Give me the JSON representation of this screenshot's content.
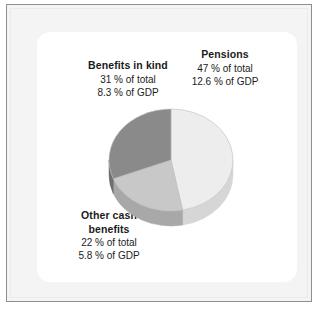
{
  "figure": {
    "background_color": "#f4f4f4",
    "card_color": "#ffffff",
    "frame_color": "#8e8e90"
  },
  "chart_data": {
    "type": "pie",
    "title": "",
    "subtitle": "",
    "xlabel": "",
    "ylabel": "",
    "legend_position": "callout-labels",
    "grid": false,
    "start_angle_deg": 0,
    "direction": "clockwise",
    "value_unit": "% of total",
    "secondary_unit": "% of GDP",
    "categories": [
      "Pensions",
      "Other cash benefits",
      "Benefits in kind"
    ],
    "values": [
      47,
      22,
      31
    ],
    "values_gdp": [
      12.6,
      5.8,
      8.3
    ],
    "colors": [
      "#ededed",
      "#c8c8c8",
      "#8a8a8a"
    ],
    "slices": [
      {
        "label": "Pensions",
        "share_of_total_pct": 47,
        "share_of_gdp_pct": 12.6,
        "color": "#ededed",
        "side_color": "#d6d6d6",
        "start_deg": 0,
        "end_deg": 169.2
      },
      {
        "label": "Other cash benefits",
        "share_of_total_pct": 22,
        "share_of_gdp_pct": 5.8,
        "color": "#c8c8c8",
        "side_color": "#a8a8a8",
        "start_deg": 169.2,
        "end_deg": 248.4
      },
      {
        "label": "Benefits in kind",
        "share_of_total_pct": 31,
        "share_of_gdp_pct": 8.3,
        "color": "#8a8a8a",
        "side_color": "#6f6f6f",
        "start_deg": 248.4,
        "end_deg": 360
      }
    ]
  },
  "labels": {
    "benefits_in_kind": {
      "category": "Benefits in kind",
      "share_line": "31 % of total",
      "gdp_line": "8.3 % of GDP"
    },
    "pensions": {
      "category": "Pensions",
      "share_line": "47 % of total",
      "gdp_line": "12.6 % of GDP"
    },
    "other_cash_benefits": {
      "category_line1": "Other cash",
      "category_line2": "benefits",
      "share_line": "22 % of total",
      "gdp_line": "5.8 % of GDP"
    }
  }
}
